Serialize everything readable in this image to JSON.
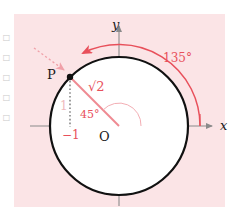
{
  "figure": {
    "kind": "unit-circle-trigonometry-diagram",
    "panel_background": "#fbe4e6",
    "page_background": "#ffffff"
  },
  "colors": {
    "panel": "#fbe4e6",
    "curve": "#111111",
    "axis": "#8a8a8a",
    "accent_red": "#e8505b",
    "pale_red": "#efb9bd",
    "label_black": "#1a1a1a"
  },
  "axes": {
    "x_label": "x",
    "y_label": "y",
    "origin_label": "O"
  },
  "points": {
    "p_label": "P"
  },
  "labels": {
    "radius": "√2",
    "angle_inner": "45°",
    "angle_outer": "135°",
    "x_coordinate": "−1",
    "y_coordinate": "1"
  },
  "margin": {
    "glyphs": [
      "□",
      "□",
      "□",
      "□",
      "□"
    ]
  },
  "geometry": {
    "center_x": 119,
    "center_y": 126,
    "radius": 69,
    "point_p_x": 70,
    "point_p_y": 77
  }
}
